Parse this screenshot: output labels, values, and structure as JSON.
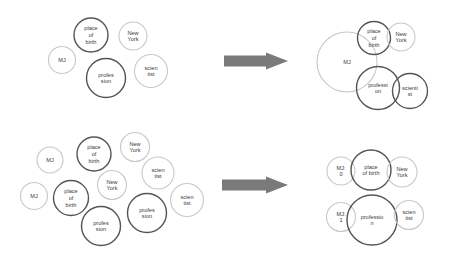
{
  "colors": {
    "dark_stroke": "#555555",
    "light_stroke": "#c8c8c8",
    "arrow": "#7a7a7a",
    "text": "#3a3a3a"
  },
  "panels": [
    {
      "id": "top-left",
      "nodes": [
        {
          "id": "mj",
          "lines": [
            "MJ"
          ],
          "cx": 62,
          "cy": 60,
          "r": 13.5,
          "style": "light"
        },
        {
          "id": "place-of-birth",
          "lines": [
            "place",
            "of",
            "birth"
          ],
          "cx": 91,
          "cy": 35,
          "r": 17,
          "style": "dark"
        },
        {
          "id": "new-york",
          "lines": [
            "New",
            "York"
          ],
          "cx": 133,
          "cy": 36,
          "r": 14,
          "style": "light"
        },
        {
          "id": "profession",
          "lines": [
            "profes",
            "sion"
          ],
          "cx": 106,
          "cy": 78,
          "r": 19.5,
          "style": "dark"
        },
        {
          "id": "scientist",
          "lines": [
            "scien",
            "tist"
          ],
          "cx": 151,
          "cy": 71,
          "r": 16.5,
          "style": "light"
        }
      ]
    },
    {
      "id": "top-right",
      "nodes": [
        {
          "id": "mj",
          "lines": [
            "MJ"
          ],
          "cx": 347,
          "cy": 62,
          "r": 30,
          "style": "light"
        },
        {
          "id": "place-of-birth",
          "lines": [
            "place",
            "of",
            "birth"
          ],
          "cx": 374,
          "cy": 38,
          "r": 16.5,
          "style": "dark"
        },
        {
          "id": "new-york",
          "lines": [
            "New",
            "York"
          ],
          "cx": 401,
          "cy": 37,
          "r": 14,
          "style": "light"
        },
        {
          "id": "profession",
          "lines": [
            "professi",
            "on"
          ],
          "cx": 378,
          "cy": 88,
          "r": 21.5,
          "style": "dark"
        },
        {
          "id": "scientist",
          "lines": [
            "scienti",
            "st"
          ],
          "cx": 410,
          "cy": 91,
          "r": 17.5,
          "style": "dark"
        }
      ]
    },
    {
      "id": "bottom-left",
      "nodes": [
        {
          "id": "mj-a",
          "lines": [
            "MJ"
          ],
          "cx": 50,
          "cy": 160,
          "r": 13,
          "style": "light"
        },
        {
          "id": "place-of-birth-a",
          "lines": [
            "place",
            "of",
            "birth"
          ],
          "cx": 94,
          "cy": 154,
          "r": 17,
          "style": "dark"
        },
        {
          "id": "new-york-a",
          "lines": [
            "New",
            "York"
          ],
          "cx": 135,
          "cy": 147,
          "r": 14.5,
          "style": "light"
        },
        {
          "id": "scientist-a",
          "lines": [
            "scien",
            "tist"
          ],
          "cx": 158,
          "cy": 173,
          "r": 16,
          "style": "light"
        },
        {
          "id": "mj-b",
          "lines": [
            "MJ"
          ],
          "cx": 34,
          "cy": 196,
          "r": 13.5,
          "style": "light"
        },
        {
          "id": "place-of-birth-b",
          "lines": [
            "place",
            "of",
            "birth"
          ],
          "cx": 71,
          "cy": 198,
          "r": 17.5,
          "style": "dark"
        },
        {
          "id": "new-york-b",
          "lines": [
            "New",
            "York"
          ],
          "cx": 112,
          "cy": 185,
          "r": 14.5,
          "style": "light"
        },
        {
          "id": "profession-a",
          "lines": [
            "profes",
            "sion"
          ],
          "cx": 101,
          "cy": 226,
          "r": 19.5,
          "style": "dark"
        },
        {
          "id": "profession-b",
          "lines": [
            "profes",
            "sion"
          ],
          "cx": 147,
          "cy": 213,
          "r": 19.5,
          "style": "dark"
        },
        {
          "id": "scientist-b",
          "lines": [
            "scien",
            "tist"
          ],
          "cx": 187,
          "cy": 200,
          "r": 16.5,
          "style": "light"
        }
      ]
    },
    {
      "id": "bottom-right",
      "nodes": [
        {
          "id": "mj-0",
          "lines": [
            "MJ:",
            "0"
          ],
          "cx": 341,
          "cy": 171,
          "r": 14,
          "style": "light"
        },
        {
          "id": "place-of-birth",
          "lines": [
            "place",
            "of birth"
          ],
          "cx": 371,
          "cy": 170,
          "r": 20,
          "style": "dark"
        },
        {
          "id": "new-york",
          "lines": [
            "New",
            "York"
          ],
          "cx": 402,
          "cy": 172,
          "r": 15,
          "style": "light"
        },
        {
          "id": "mj-1",
          "lines": [
            "MJ:",
            "1"
          ],
          "cx": 341,
          "cy": 217,
          "r": 14.5,
          "style": "light"
        },
        {
          "id": "profession",
          "lines": [
            "professio",
            "n"
          ],
          "cx": 372,
          "cy": 220,
          "r": 25,
          "style": "dark"
        },
        {
          "id": "scientist",
          "lines": [
            "scien",
            "tist"
          ],
          "cx": 409,
          "cy": 215,
          "r": 14.5,
          "style": "light"
        }
      ]
    }
  ],
  "arrows": [
    {
      "id": "top-arrow",
      "x1": 224,
      "x2": 288,
      "cy": 61,
      "shaft_h": 11,
      "head_h": 17,
      "head_len": 22
    },
    {
      "id": "bottom-arrow",
      "x1": 222,
      "x2": 288,
      "cy": 185,
      "shaft_h": 11,
      "head_h": 17,
      "head_len": 22
    }
  ]
}
